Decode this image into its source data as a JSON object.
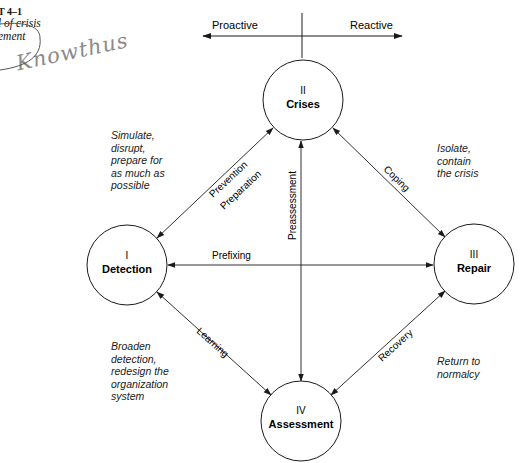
{
  "exhibit": {
    "number": "T 4–1",
    "caption_lines": [
      "l of crisis",
      "ement"
    ]
  },
  "handwriting": "Knowthus",
  "axis": {
    "left_label": "Proactive",
    "right_label": "Reactive"
  },
  "nodes": [
    {
      "id": "crises",
      "numeral": "II",
      "name": "Crises",
      "cx": 303,
      "cy": 100,
      "r": 40
    },
    {
      "id": "detection",
      "numeral": "I",
      "name": "Detection",
      "cx": 127,
      "cy": 265,
      "r": 40
    },
    {
      "id": "repair",
      "numeral": "III",
      "name": "Repair",
      "cx": 474,
      "cy": 264,
      "r": 40
    },
    {
      "id": "assessment",
      "numeral": "IV",
      "name": "Assessment",
      "cx": 301,
      "cy": 422,
      "r": 40
    }
  ],
  "edges": {
    "prevention": "Prevention",
    "preparation": "Preparation",
    "coping": "Coping",
    "prefixing": "Prefixing",
    "preassessment": "Preassessment",
    "learning": "Learning",
    "recovery": "Recovery"
  },
  "notes": {
    "top_left": "Simulate,\ndisrupt,\nprepare for\nas much as\npossible",
    "top_right": "Isolate,\ncontain\nthe crisis",
    "bottom_left": "Broaden\ndetection,\nredesign the\norganization\nsystem",
    "bottom_right": "Return to\nnormalcy"
  },
  "colors": {
    "ink": "#1a1a1a",
    "pencil": "#8a8a8a"
  }
}
